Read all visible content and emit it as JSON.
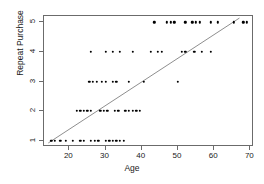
{
  "chart_data": {
    "type": "scatter",
    "title": "",
    "xlabel": "Age",
    "ylabel": "Repeat Purchase",
    "xlim": [
      13,
      71
    ],
    "ylim": [
      0.78,
      5.22
    ],
    "grid": false,
    "legend": "none",
    "xticks": [
      20,
      30,
      40,
      50,
      60,
      70
    ],
    "yticks": [
      1,
      2,
      3,
      4,
      5
    ],
    "point_color": "#000000",
    "line_color": "#808080",
    "frame_color": "#6b6b6b",
    "fit_line": {
      "label": "regression line",
      "x": [
        14.2,
        67.5
      ],
      "y": [
        0.85,
        5.15
      ]
    },
    "points": [
      {
        "x": 15,
        "y": 1
      },
      {
        "x": 16,
        "y": 1
      },
      {
        "x": 17.5,
        "y": 1
      },
      {
        "x": 19,
        "y": 1
      },
      {
        "x": 21,
        "y": 1
      },
      {
        "x": 23,
        "y": 1
      },
      {
        "x": 24,
        "y": 1
      },
      {
        "x": 26,
        "y": 1
      },
      {
        "x": 27,
        "y": 1
      },
      {
        "x": 28,
        "y": 1
      },
      {
        "x": 30,
        "y": 1
      },
      {
        "x": 31,
        "y": 1
      },
      {
        "x": 32,
        "y": 1
      },
      {
        "x": 33,
        "y": 1
      },
      {
        "x": 34,
        "y": 1
      },
      {
        "x": 35,
        "y": 1
      },
      {
        "x": 22,
        "y": 2
      },
      {
        "x": 23,
        "y": 2
      },
      {
        "x": 24,
        "y": 2
      },
      {
        "x": 25,
        "y": 2
      },
      {
        "x": 26,
        "y": 2
      },
      {
        "x": 28.5,
        "y": 2
      },
      {
        "x": 29.5,
        "y": 2
      },
      {
        "x": 30.5,
        "y": 2
      },
      {
        "x": 32.5,
        "y": 2
      },
      {
        "x": 33.5,
        "y": 2
      },
      {
        "x": 35.5,
        "y": 2
      },
      {
        "x": 36.5,
        "y": 2
      },
      {
        "x": 37.5,
        "y": 2
      },
      {
        "x": 38.5,
        "y": 2
      },
      {
        "x": 39.5,
        "y": 2
      },
      {
        "x": 25.5,
        "y": 3
      },
      {
        "x": 26.5,
        "y": 3
      },
      {
        "x": 27.5,
        "y": 3
      },
      {
        "x": 29,
        "y": 3
      },
      {
        "x": 30,
        "y": 3
      },
      {
        "x": 32,
        "y": 3
      },
      {
        "x": 33,
        "y": 3
      },
      {
        "x": 36.5,
        "y": 3
      },
      {
        "x": 40.5,
        "y": 3
      },
      {
        "x": 50,
        "y": 3
      },
      {
        "x": 26,
        "y": 4
      },
      {
        "x": 30,
        "y": 4
      },
      {
        "x": 32,
        "y": 4
      },
      {
        "x": 34,
        "y": 4
      },
      {
        "x": 37.5,
        "y": 4
      },
      {
        "x": 42.5,
        "y": 4
      },
      {
        "x": 44.5,
        "y": 4
      },
      {
        "x": 45.5,
        "y": 4
      },
      {
        "x": 51,
        "y": 4
      },
      {
        "x": 52,
        "y": 4
      },
      {
        "x": 54.5,
        "y": 4
      },
      {
        "x": 56.5,
        "y": 4
      },
      {
        "x": 59,
        "y": 4
      },
      {
        "x": 43.5,
        "y": 5
      },
      {
        "x": 47,
        "y": 5
      },
      {
        "x": 48,
        "y": 5
      },
      {
        "x": 49,
        "y": 5
      },
      {
        "x": 52,
        "y": 5
      },
      {
        "x": 54,
        "y": 5
      },
      {
        "x": 55,
        "y": 5
      },
      {
        "x": 56,
        "y": 5
      },
      {
        "x": 59,
        "y": 5
      },
      {
        "x": 61,
        "y": 5
      },
      {
        "x": 65.5,
        "y": 5
      },
      {
        "x": 68,
        "y": 5
      },
      {
        "x": 69,
        "y": 5
      }
    ]
  }
}
